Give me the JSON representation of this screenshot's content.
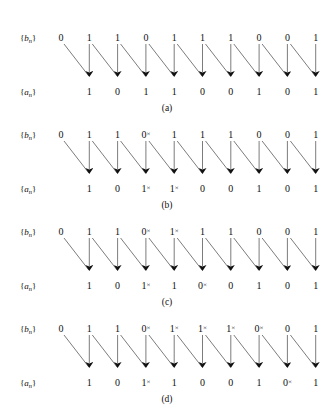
{
  "figure": {
    "type": "signal-mapping-diagram",
    "width": 334,
    "height": 414,
    "background": "#ffffff",
    "line_color": "#5a5a5a",
    "text_color": "#111111",
    "top_row_label": "{b",
    "top_row_label_sub": "n",
    "top_row_label_end": "}",
    "bottom_row_label": "{a",
    "bottom_row_label_sub": "n",
    "bottom_row_label_end": "}",
    "marker": "×"
  },
  "panels": [
    {
      "id": "a",
      "caption": "(a)",
      "top_label": "{b",
      "bottom_label": "{a",
      "top_bits": [
        {
          "value": "0",
          "marked": false
        },
        {
          "value": "1",
          "marked": false
        },
        {
          "value": "1",
          "marked": false
        },
        {
          "value": "0",
          "marked": false
        },
        {
          "value": "1",
          "marked": false
        },
        {
          "value": "1",
          "marked": false
        },
        {
          "value": "1",
          "marked": false
        },
        {
          "value": "0",
          "marked": false
        },
        {
          "value": "0",
          "marked": false
        },
        {
          "value": "1",
          "marked": false
        }
      ],
      "bottom_bits": [
        {
          "value": "1",
          "marked": false
        },
        {
          "value": "0",
          "marked": false
        },
        {
          "value": "1",
          "marked": false
        },
        {
          "value": "1",
          "marked": false
        },
        {
          "value": "0",
          "marked": false
        },
        {
          "value": "0",
          "marked": false
        },
        {
          "value": "1",
          "marked": false
        },
        {
          "value": "0",
          "marked": false
        },
        {
          "value": "1",
          "marked": false
        }
      ]
    },
    {
      "id": "b",
      "caption": "(b)",
      "top_label": "{b",
      "bottom_label": "{a",
      "top_bits": [
        {
          "value": "0",
          "marked": false
        },
        {
          "value": "1",
          "marked": false
        },
        {
          "value": "1",
          "marked": false
        },
        {
          "value": "0",
          "marked": true
        },
        {
          "value": "1",
          "marked": false
        },
        {
          "value": "1",
          "marked": false
        },
        {
          "value": "1",
          "marked": false
        },
        {
          "value": "0",
          "marked": false
        },
        {
          "value": "0",
          "marked": false
        },
        {
          "value": "1",
          "marked": false
        }
      ],
      "bottom_bits": [
        {
          "value": "1",
          "marked": false
        },
        {
          "value": "0",
          "marked": false
        },
        {
          "value": "1",
          "marked": true
        },
        {
          "value": "1",
          "marked": true
        },
        {
          "value": "0",
          "marked": false
        },
        {
          "value": "0",
          "marked": false
        },
        {
          "value": "1",
          "marked": false
        },
        {
          "value": "0",
          "marked": false
        },
        {
          "value": "1",
          "marked": false
        }
      ]
    },
    {
      "id": "c",
      "caption": "(c)",
      "top_label": "{b",
      "bottom_label": "{a",
      "top_bits": [
        {
          "value": "0",
          "marked": false
        },
        {
          "value": "1",
          "marked": false
        },
        {
          "value": "1",
          "marked": false
        },
        {
          "value": "0",
          "marked": true
        },
        {
          "value": "1",
          "marked": true
        },
        {
          "value": "1",
          "marked": false
        },
        {
          "value": "1",
          "marked": false
        },
        {
          "value": "0",
          "marked": false
        },
        {
          "value": "0",
          "marked": false
        },
        {
          "value": "1",
          "marked": false
        }
      ],
      "bottom_bits": [
        {
          "value": "1",
          "marked": false
        },
        {
          "value": "0",
          "marked": false
        },
        {
          "value": "1",
          "marked": true
        },
        {
          "value": "1",
          "marked": false
        },
        {
          "value": "0",
          "marked": true
        },
        {
          "value": "0",
          "marked": false
        },
        {
          "value": "1",
          "marked": false
        },
        {
          "value": "0",
          "marked": false
        },
        {
          "value": "1",
          "marked": false
        }
      ]
    },
    {
      "id": "d",
      "caption": "(d)",
      "top_label": "{b",
      "bottom_label": "{a",
      "top_bits": [
        {
          "value": "0",
          "marked": false
        },
        {
          "value": "1",
          "marked": false
        },
        {
          "value": "1",
          "marked": false
        },
        {
          "value": "0",
          "marked": true
        },
        {
          "value": "1",
          "marked": true
        },
        {
          "value": "1",
          "marked": true
        },
        {
          "value": "1",
          "marked": true
        },
        {
          "value": "0",
          "marked": true
        },
        {
          "value": "0",
          "marked": false
        },
        {
          "value": "1",
          "marked": false
        }
      ],
      "bottom_bits": [
        {
          "value": "1",
          "marked": false
        },
        {
          "value": "0",
          "marked": false
        },
        {
          "value": "1",
          "marked": true
        },
        {
          "value": "1",
          "marked": false
        },
        {
          "value": "0",
          "marked": false
        },
        {
          "value": "0",
          "marked": false
        },
        {
          "value": "1",
          "marked": false
        },
        {
          "value": "0",
          "marked": true
        },
        {
          "value": "1",
          "marked": false
        }
      ]
    }
  ]
}
